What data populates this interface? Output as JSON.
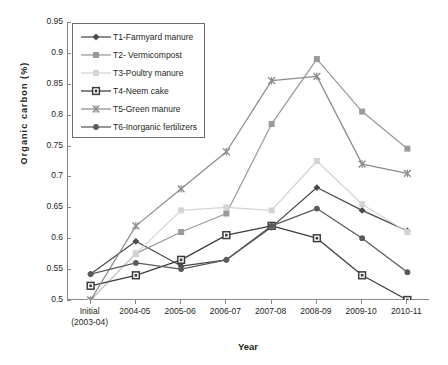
{
  "chart_data": {
    "type": "line",
    "title": "",
    "xlabel": "Year",
    "ylabel": "Organic carbon (%)",
    "ylim": [
      0.5,
      0.95
    ],
    "ytick_step": 0.05,
    "grid": false,
    "legend_position": "top-left",
    "categories": [
      "Initial\n(2003-04)",
      "2004-05",
      "2005-06",
      "2006-07",
      "2007-08",
      "2008-09",
      "2009-10",
      "2010-11"
    ],
    "category_labels": [
      {
        "line1": "Initial",
        "line2": "(2003-04)"
      },
      {
        "line1": "2004-05",
        "line2": ""
      },
      {
        "line1": "2005-06",
        "line2": ""
      },
      {
        "line1": "2006-07",
        "line2": ""
      },
      {
        "line1": "2007-08",
        "line2": ""
      },
      {
        "line1": "2008-09",
        "line2": ""
      },
      {
        "line1": "2009-10",
        "line2": ""
      },
      {
        "line1": "2010-11",
        "line2": ""
      }
    ],
    "ytick_labels": [
      "0.95",
      "0.9",
      "0.85",
      "0.8",
      "0.75",
      "0.7",
      "0.65",
      "0.6",
      "0.55",
      "0.5"
    ],
    "ytick_values": [
      0.95,
      0.9,
      0.85,
      0.8,
      0.75,
      0.7,
      0.65,
      0.6,
      0.55,
      0.5
    ],
    "series": [
      {
        "name": "T1-Farmyard manure",
        "marker": "diamond",
        "color": "#4a4a4a",
        "values": [
          0.542,
          0.595,
          0.555,
          0.565,
          0.618,
          0.682,
          0.645,
          0.612
        ]
      },
      {
        "name": "T2- Vermicompost",
        "marker": "square",
        "color": "#9a9a9a",
        "values": [
          0.5,
          0.575,
          0.61,
          0.64,
          0.785,
          0.89,
          0.805,
          0.745
        ]
      },
      {
        "name": "T3-Poultry manure",
        "marker": "square-light",
        "color": "#d4d4d4",
        "values": [
          0.5,
          0.575,
          0.645,
          0.65,
          0.645,
          0.725,
          0.655,
          0.61
        ]
      },
      {
        "name": "T4-Neem cake",
        "marker": "square-outline",
        "color": "#3c3c3c",
        "values": [
          0.523,
          0.54,
          0.565,
          0.605,
          0.62,
          0.6,
          0.54,
          0.5
        ]
      },
      {
        "name": "T5-Green manure",
        "marker": "cross",
        "color": "#8c8c8c",
        "values": [
          0.5,
          0.62,
          0.68,
          0.74,
          0.855,
          0.862,
          0.72,
          0.705
        ]
      },
      {
        "name": "T6-Inorganic fertilizers",
        "marker": "dot",
        "color": "#5a5a5a",
        "values": [
          0.542,
          0.56,
          0.55,
          0.565,
          0.62,
          0.648,
          0.6,
          0.545
        ]
      }
    ]
  },
  "axes": {
    "y_title": "Organic carbon (%)",
    "x_title": "Year"
  }
}
